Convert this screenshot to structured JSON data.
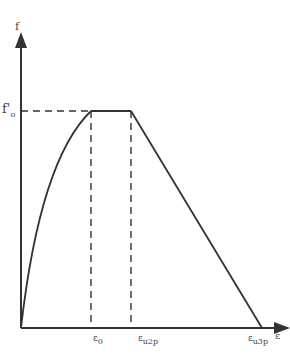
{
  "diagram": {
    "type": "stress-strain-curve",
    "axes": {
      "y_label": "f",
      "x_label": "ε"
    },
    "peak_label": {
      "base": "f",
      "sub": "o"
    },
    "x_ticks": [
      {
        "base": "ε",
        "sub": "0"
      },
      {
        "base": "ε",
        "sub": "u2p"
      },
      {
        "base": "ε",
        "sub": "u3p"
      }
    ],
    "colors": {
      "line": "#333333",
      "background": "#ffffff"
    }
  }
}
